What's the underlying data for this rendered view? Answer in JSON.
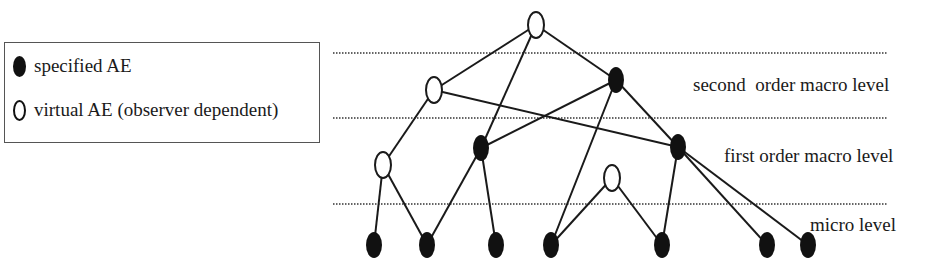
{
  "legend": {
    "items": [
      {
        "symbol": "filled-ellipse",
        "label": "specified AE"
      },
      {
        "symbol": "hollow-ellipse",
        "label": "virtual AE (observer dependent)"
      }
    ]
  },
  "levels": [
    {
      "label": "second  order macro level"
    },
    {
      "label": "first order macro level"
    },
    {
      "label": "micro level"
    }
  ],
  "colors": {
    "line": "#1a1a1a",
    "filled": "#111111",
    "dotted": "#333333"
  },
  "graph": {
    "nodes": [
      {
        "id": "top",
        "x": 536,
        "y": 25,
        "type": "virtual"
      },
      {
        "id": "v2a",
        "x": 434,
        "y": 90,
        "type": "virtual"
      },
      {
        "id": "s2a",
        "x": 616,
        "y": 80,
        "type": "specified"
      },
      {
        "id": "v1a",
        "x": 383,
        "y": 165,
        "type": "virtual"
      },
      {
        "id": "s1a",
        "x": 481,
        "y": 148,
        "type": "specified"
      },
      {
        "id": "s1b",
        "x": 678,
        "y": 147,
        "type": "specified"
      },
      {
        "id": "v1b",
        "x": 612,
        "y": 178,
        "type": "virtual"
      },
      {
        "id": "m1",
        "x": 374,
        "y": 245,
        "type": "specified"
      },
      {
        "id": "m2",
        "x": 427,
        "y": 245,
        "type": "specified"
      },
      {
        "id": "m3",
        "x": 496,
        "y": 245,
        "type": "specified"
      },
      {
        "id": "m4",
        "x": 551,
        "y": 245,
        "type": "specified"
      },
      {
        "id": "m5",
        "x": 662,
        "y": 245,
        "type": "specified"
      },
      {
        "id": "m6",
        "x": 767,
        "y": 245,
        "type": "specified"
      },
      {
        "id": "m7",
        "x": 808,
        "y": 245,
        "type": "specified"
      }
    ],
    "edges": [
      [
        "top",
        "v2a"
      ],
      [
        "top",
        "s1a"
      ],
      [
        "top",
        "s2a"
      ],
      [
        "v2a",
        "v1a"
      ],
      [
        "v2a",
        "s1b"
      ],
      [
        "s2a",
        "s1a"
      ],
      [
        "s2a",
        "m4"
      ],
      [
        "s2a",
        "s1b"
      ],
      [
        "v1a",
        "m1"
      ],
      [
        "v1a",
        "m2"
      ],
      [
        "s1a",
        "m2"
      ],
      [
        "s1a",
        "m3"
      ],
      [
        "v1b",
        "m4"
      ],
      [
        "v1b",
        "m5"
      ],
      [
        "s1b",
        "m5"
      ],
      [
        "s1b",
        "m6"
      ],
      [
        "s1b",
        "m7"
      ]
    ],
    "dotted_lines_y": [
      53,
      118,
      204
    ]
  }
}
